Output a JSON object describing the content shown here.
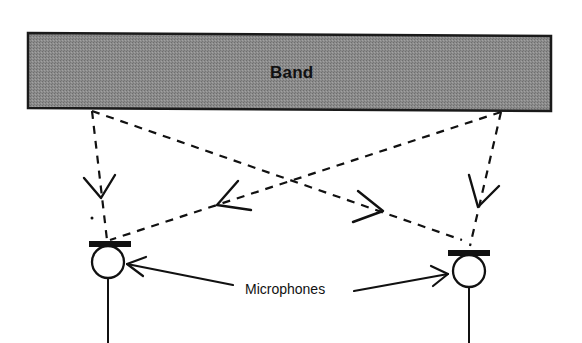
{
  "diagram": {
    "type": "microphone-placement",
    "band": {
      "label": "Band",
      "fill": "#8a8a8a",
      "stroke": "#1a1a1a"
    },
    "microphones_label": "Microphones",
    "microphones": [
      {
        "id": "left-mic",
        "cx": 108,
        "cy": 262
      },
      {
        "id": "right-mic",
        "cx": 469,
        "cy": 270
      }
    ],
    "signal_paths": [
      {
        "id": "band-left-to-left-mic",
        "style": "dashed",
        "direction": "down"
      },
      {
        "id": "band-left-to-right-mic",
        "style": "dashed",
        "direction": "cross-right"
      },
      {
        "id": "band-right-to-left-mic",
        "style": "dashed",
        "direction": "cross-left"
      },
      {
        "id": "band-right-to-right-mic",
        "style": "dashed",
        "direction": "down"
      }
    ],
    "colors": {
      "line": "#111111",
      "background": "#ffffff"
    }
  }
}
